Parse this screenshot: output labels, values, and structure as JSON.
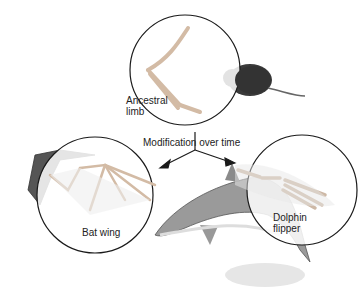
{
  "diagram": {
    "center_label": "Modification over time",
    "nodes": [
      {
        "id": "ancestral",
        "label_line1": "Ancestral",
        "label_line2": "limb",
        "animal": "mouse"
      },
      {
        "id": "bat",
        "label": "Bat wing",
        "animal": "bat"
      },
      {
        "id": "dolphin",
        "label_line1": "Dolphin",
        "label_line2": "flipper",
        "animal": "dolphin"
      }
    ],
    "edges": [
      {
        "from": "ancestral",
        "to": "bat"
      },
      {
        "from": "ancestral",
        "to": "dolphin"
      }
    ],
    "colors": {
      "outline": "#1a1a1a",
      "bone": "#d9c3b0",
      "animal": "#555555",
      "dolphin": "#8a8a8a"
    }
  }
}
